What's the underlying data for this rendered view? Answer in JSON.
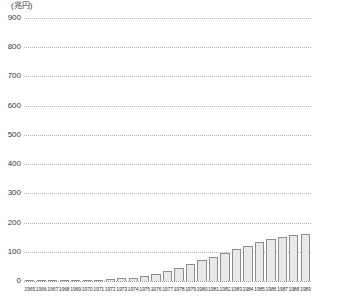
{
  "chart_data": {
    "type": "bar",
    "title": "",
    "subtitle": "",
    "unit_label": "(兆円)",
    "xlabel": "",
    "ylabel": "",
    "ylim": [
      0,
      900
    ],
    "yticks": [
      900,
      800,
      700,
      600,
      500,
      400,
      300,
      200,
      100,
      0
    ],
    "ytick_labels": [
      "900",
      "800",
      "700",
      "600",
      "500",
      "400",
      "300",
      "200",
      "100",
      "0"
    ],
    "grid": true,
    "grid_style": "dotted",
    "legend": null,
    "legend_position": "none",
    "categories": [
      "1965",
      "1966",
      "1967",
      "1968",
      "1969",
      "1970",
      "1971",
      "1972",
      "1973",
      "1974",
      "1975",
      "1976",
      "1977",
      "1978",
      "1979",
      "1980",
      "1981",
      "1982",
      "1983",
      "1984",
      "1985",
      "1986",
      "1987",
      "1988",
      "1989"
    ],
    "values": [
      1,
      1,
      2,
      2,
      3,
      3,
      5,
      7,
      9,
      11,
      16,
      24,
      33,
      45,
      59,
      72,
      81,
      96,
      110,
      121,
      134,
      143,
      150,
      156,
      160
    ],
    "series": [
      {
        "name": "",
        "values": [
          1,
          1,
          2,
          2,
          3,
          3,
          5,
          7,
          9,
          11,
          16,
          24,
          33,
          45,
          59,
          72,
          81,
          96,
          110,
          121,
          134,
          143,
          150,
          156,
          160
        ]
      }
    ],
    "bar_fill_color": "#e9e9e9",
    "bar_border_color": "#8d8d8d",
    "grid_color": "#b9b9b9",
    "text_color": "#3a3a3a",
    "background_color": "#ffffff"
  }
}
